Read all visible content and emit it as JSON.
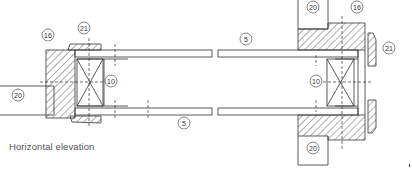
{
  "caption": "Horizontal elevation",
  "labels": {
    "left_16": "16",
    "left_21": "21",
    "left_10": "10",
    "left_20": "20",
    "bottom_5": "5",
    "top_5": "5",
    "right_20_top": "20",
    "right_16": "16",
    "right_21": "21",
    "right_10": "10",
    "right_20_bottom": "20"
  },
  "colors": {
    "line": "#333333",
    "text": "#555555"
  }
}
